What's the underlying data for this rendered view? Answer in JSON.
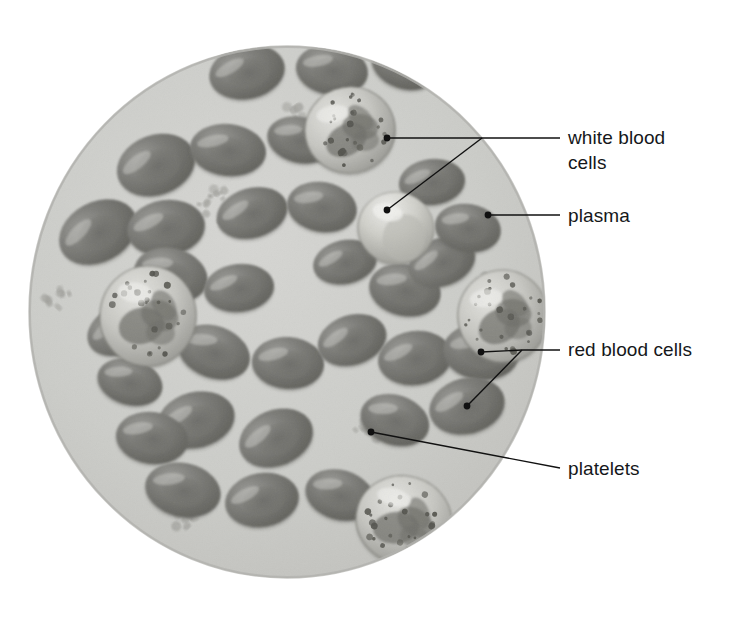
{
  "figure": {
    "canvas": {
      "width": 732,
      "height": 638
    },
    "background_color": "#ffffff"
  },
  "field": {
    "name": "blood-sample-circle",
    "shape": "ellipse",
    "center_x": 287,
    "center_y": 312,
    "radius_x": 258,
    "radius_y": 266,
    "fill_color": "#ccccc9",
    "edge_color": "#b9b9b5",
    "description": "Circular microscope field of view filled with plasma"
  },
  "labels": [
    {
      "id": "white-blood-cells",
      "text": "white blood\ncells",
      "line1": "white blood",
      "line2": "cells",
      "text_x": 568,
      "text_y": 125,
      "color": "#15171a",
      "font_size": 19,
      "leader": {
        "junction_x": 482,
        "junction_y": 138,
        "text_anchor_x": 560,
        "text_anchor_y": 138,
        "dots": [
          {
            "x": 387,
            "y": 138
          },
          {
            "x": 387,
            "y": 210
          }
        ]
      }
    },
    {
      "id": "plasma",
      "text": "plasma",
      "line1": "plasma",
      "line2": "",
      "text_x": 568,
      "text_y": 203,
      "color": "#15171a",
      "font_size": 19,
      "leader": {
        "junction_x": 560,
        "junction_y": 215,
        "text_anchor_x": 560,
        "text_anchor_y": 215,
        "dots": [
          {
            "x": 488,
            "y": 215
          }
        ]
      }
    },
    {
      "id": "red-blood-cells",
      "text": "red blood cells",
      "line1": "red blood cells",
      "line2": "",
      "text_x": 568,
      "text_y": 337,
      "color": "#15171a",
      "font_size": 19,
      "leader": {
        "junction_x": 522,
        "junction_y": 350,
        "text_anchor_x": 560,
        "text_anchor_y": 350,
        "dots": [
          {
            "x": 481,
            "y": 352
          },
          {
            "x": 467,
            "y": 406
          }
        ]
      }
    },
    {
      "id": "platelets",
      "text": "platelets",
      "line1": "platelets",
      "line2": "",
      "text_x": 568,
      "text_y": 456,
      "color": "#15171a",
      "font_size": 19,
      "leader": {
        "junction_x": 560,
        "junction_y": 468,
        "text_anchor_x": 560,
        "text_anchor_y": 468,
        "dots": [
          {
            "x": 371,
            "y": 432
          }
        ]
      }
    }
  ],
  "cells": {
    "red_blood_cells": {
      "name": "red-blood-cell",
      "count": 33,
      "fill_color": "#7f7f7b",
      "rim_color": "#6d6d69",
      "highlight_color": "#b4b4b0",
      "shape": "biconcave-disc",
      "items": [
        {
          "cx": 247,
          "cy": 72,
          "rx": 38,
          "ry": 27,
          "rot": -12
        },
        {
          "cx": 332,
          "cy": 70,
          "rx": 36,
          "ry": 25,
          "rot": 8
        },
        {
          "cx": 156,
          "cy": 165,
          "rx": 40,
          "ry": 30,
          "rot": -20
        },
        {
          "cx": 228,
          "cy": 150,
          "rx": 38,
          "ry": 26,
          "rot": 6
        },
        {
          "cx": 405,
          "cy": 65,
          "rx": 34,
          "ry": 24,
          "rot": 18
        },
        {
          "cx": 98,
          "cy": 232,
          "rx": 41,
          "ry": 30,
          "rot": -28
        },
        {
          "cx": 166,
          "cy": 228,
          "rx": 39,
          "ry": 28,
          "rot": -8
        },
        {
          "cx": 171,
          "cy": 275,
          "rx": 37,
          "ry": 27,
          "rot": 14
        },
        {
          "cx": 252,
          "cy": 213,
          "rx": 36,
          "ry": 25,
          "rot": -16
        },
        {
          "cx": 322,
          "cy": 207,
          "rx": 35,
          "ry": 25,
          "rot": 10
        },
        {
          "cx": 239,
          "cy": 288,
          "rx": 35,
          "ry": 24,
          "rot": -6
        },
        {
          "cx": 214,
          "cy": 352,
          "rx": 37,
          "ry": 26,
          "rot": 20
        },
        {
          "cx": 196,
          "cy": 420,
          "rx": 39,
          "ry": 28,
          "rot": -14
        },
        {
          "cx": 152,
          "cy": 438,
          "rx": 36,
          "ry": 26,
          "rot": 8
        },
        {
          "cx": 276,
          "cy": 438,
          "rx": 38,
          "ry": 28,
          "rot": -22
        },
        {
          "cx": 183,
          "cy": 490,
          "rx": 38,
          "ry": 27,
          "rot": 12
        },
        {
          "cx": 262,
          "cy": 500,
          "rx": 37,
          "ry": 27,
          "rot": -10
        },
        {
          "cx": 340,
          "cy": 495,
          "rx": 35,
          "ry": 25,
          "rot": 16
        },
        {
          "cx": 288,
          "cy": 363,
          "rx": 36,
          "ry": 26,
          "rot": 4
        },
        {
          "cx": 352,
          "cy": 340,
          "rx": 35,
          "ry": 25,
          "rot": -18
        },
        {
          "cx": 405,
          "cy": 290,
          "rx": 36,
          "ry": 26,
          "rot": 12
        },
        {
          "cx": 415,
          "cy": 358,
          "rx": 37,
          "ry": 27,
          "rot": -8
        },
        {
          "cx": 481,
          "cy": 352,
          "rx": 38,
          "ry": 28,
          "rot": 6
        },
        {
          "cx": 467,
          "cy": 406,
          "rx": 38,
          "ry": 28,
          "rot": -14
        },
        {
          "cx": 395,
          "cy": 420,
          "rx": 35,
          "ry": 25,
          "rot": 18
        },
        {
          "cx": 442,
          "cy": 262,
          "rx": 34,
          "ry": 24,
          "rot": -20
        },
        {
          "cx": 300,
          "cy": 140,
          "rx": 33,
          "ry": 23,
          "rot": 14
        },
        {
          "cx": 432,
          "cy": 182,
          "rx": 33,
          "ry": 23,
          "rot": -6
        },
        {
          "cx": 468,
          "cy": 228,
          "rx": 33,
          "ry": 24,
          "rot": 10
        },
        {
          "cx": 120,
          "cy": 330,
          "rx": 34,
          "ry": 24,
          "rot": -24
        },
        {
          "cx": 130,
          "cy": 382,
          "rx": 33,
          "ry": 23,
          "rot": 16
        },
        {
          "cx": 345,
          "cy": 262,
          "rx": 32,
          "ry": 22,
          "rot": -12
        },
        {
          "cx": 505,
          "cy": 300,
          "rx": 33,
          "ry": 24,
          "rot": 8
        }
      ]
    },
    "white_blood_cells": {
      "name": "white-blood-cell",
      "count": 5,
      "cytoplasm_color": "#c9c9c4",
      "nucleus_color": "#6f6f6b",
      "granule_color": "#55554f",
      "items": [
        {
          "cx": 350,
          "cy": 130,
          "rx": 45,
          "ry": 43,
          "type": "granulocyte",
          "rot": -10
        },
        {
          "cx": 148,
          "cy": 316,
          "rx": 48,
          "ry": 50,
          "type": "granulocyte",
          "rot": 6
        },
        {
          "cx": 396,
          "cy": 228,
          "rx": 38,
          "ry": 36,
          "type": "smooth-lobed",
          "rot": 12
        },
        {
          "cx": 503,
          "cy": 316,
          "rx": 45,
          "ry": 46,
          "type": "granulocyte",
          "rot": -8
        },
        {
          "cx": 404,
          "cy": 520,
          "rx": 48,
          "ry": 44,
          "type": "granulocyte",
          "rot": 15
        }
      ]
    },
    "platelets": {
      "name": "platelet",
      "color": "#a9a9a4",
      "outline_color": "#8b8b86",
      "description": "small irregular cell fragments in clusters",
      "clusters": [
        {
          "cx": 220,
          "cy": 205,
          "spread": 22,
          "count": 12
        },
        {
          "cx": 371,
          "cy": 428,
          "spread": 22,
          "count": 13
        },
        {
          "cx": 60,
          "cy": 292,
          "spread": 18,
          "count": 8
        },
        {
          "cx": 185,
          "cy": 520,
          "spread": 16,
          "count": 7
        },
        {
          "cx": 490,
          "cy": 280,
          "spread": 14,
          "count": 6
        },
        {
          "cx": 300,
          "cy": 110,
          "spread": 14,
          "count": 5
        }
      ]
    }
  },
  "style": {
    "leader_line_color": "#111111",
    "leader_line_width": 1.4,
    "dot_radius": 3.4,
    "text_color": "#15171a"
  }
}
